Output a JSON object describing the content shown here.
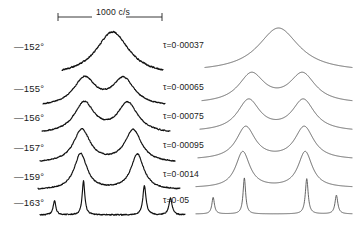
{
  "figure": {
    "background_color": "#ffffff",
    "trace_color": "#111111",
    "calc_color": "#4a4a4a"
  },
  "scale_bar": {
    "label": "1000 c/s",
    "units": "c/s",
    "value": 1000,
    "x_start_px": 58,
    "x_end_px": 162
  },
  "left_labels": [
    {
      "label": "—152°",
      "temperature": -152,
      "unit": "°"
    },
    {
      "label": "—155°",
      "temperature": -155,
      "unit": "°"
    },
    {
      "label": "—156°",
      "temperature": -156,
      "unit": "°"
    },
    {
      "label": "—157°",
      "temperature": -157,
      "unit": "°"
    },
    {
      "label": "—159°",
      "temperature": -159,
      "unit": "°"
    },
    {
      "label": "—163°",
      "temperature": -163,
      "unit": "°"
    }
  ],
  "tau_labels": [
    {
      "label": "τ=0·00037",
      "tau": 0.00037
    },
    {
      "label": "τ=0·00065",
      "tau": 0.00065
    },
    {
      "label": "τ=0·00075",
      "tau": 0.00075
    },
    {
      "label": "τ=0·00095",
      "tau": 0.00095
    },
    {
      "label": "τ=0·0014",
      "tau": 0.0014
    },
    {
      "label": "τ=0·05",
      "tau": 0.05
    }
  ],
  "chart_data": {
    "type": "line",
    "xlabel": "",
    "ylabel": "",
    "grid": false,
    "legend": "none",
    "x_scale_note": "Horizontal scale bar spans 1000 c/s",
    "panels": [
      {
        "name": "observed",
        "description": "Experimental noisy spectrometer traces stacked by temperature",
        "noise": true,
        "series": [
          {
            "name": "-152",
            "temperature": -152,
            "peaks": [
              {
                "center": 0.5,
                "height": 1.0,
                "width": 0.4
              }
            ],
            "baseline_tilt": 0.1,
            "noise_amplitude": 0.05
          },
          {
            "name": "-155",
            "temperature": -155,
            "peaks": [
              {
                "center": 0.34,
                "height": 0.82,
                "width": 0.22
              },
              {
                "center": 0.66,
                "height": 0.8,
                "width": 0.22
              }
            ],
            "dip": 0.1,
            "baseline_tilt": 0.12,
            "noise_amplitude": 0.05
          },
          {
            "name": "-156",
            "temperature": -156,
            "peaks": [
              {
                "center": 0.33,
                "height": 0.9,
                "width": 0.19
              },
              {
                "center": 0.67,
                "height": 0.88,
                "width": 0.19
              }
            ],
            "dip": 0.22,
            "baseline_tilt": 0.12,
            "noise_amplitude": 0.05
          },
          {
            "name": "-157",
            "temperature": -157,
            "peaks": [
              {
                "center": 0.31,
                "height": 0.97,
                "width": 0.15
              },
              {
                "center": 0.69,
                "height": 0.95,
                "width": 0.15
              }
            ],
            "dip": 0.34,
            "baseline_tilt": 0.12,
            "noise_amplitude": 0.05
          },
          {
            "name": "-159",
            "temperature": -159,
            "peaks": [
              {
                "center": 0.3,
                "height": 1.0,
                "width": 0.11
              },
              {
                "center": 0.7,
                "height": 0.98,
                "width": 0.11
              }
            ],
            "dip": 0.52,
            "baseline_tilt": 0.12,
            "noise_amplitude": 0.05
          },
          {
            "name": "-163",
            "temperature": -163,
            "peaks": [
              {
                "center": 0.1,
                "height": 0.42,
                "width": 0.022
              },
              {
                "center": 0.3,
                "height": 1.0,
                "width": 0.022
              },
              {
                "center": 0.72,
                "height": 0.86,
                "width": 0.026
              },
              {
                "center": 0.9,
                "height": 0.5,
                "width": 0.026
              }
            ],
            "dip": 0.92,
            "baseline_tilt": 0.04,
            "noise_amplitude": 0.055
          }
        ]
      },
      {
        "name": "calculated",
        "description": "Smooth computed lineshapes stacked by correlation time tau",
        "noise": false,
        "series": [
          {
            "name": "tau=0.00037",
            "tau": 0.00037,
            "peaks": [
              {
                "center": 0.5,
                "height": 1.0,
                "width": 0.34
              }
            ],
            "dip": 0.0
          },
          {
            "name": "tau=0.00065",
            "tau": 0.00065,
            "peaks": [
              {
                "center": 0.33,
                "height": 0.86,
                "width": 0.21
              },
              {
                "center": 0.67,
                "height": 0.86,
                "width": 0.21
              }
            ],
            "dip": 0.13
          },
          {
            "name": "tau=0.00075",
            "tau": 0.00075,
            "peaks": [
              {
                "center": 0.32,
                "height": 0.92,
                "width": 0.18
              },
              {
                "center": 0.68,
                "height": 0.92,
                "width": 0.18
              }
            ],
            "dip": 0.27
          },
          {
            "name": "tau=0.00095",
            "tau": 0.00095,
            "peaks": [
              {
                "center": 0.31,
                "height": 0.96,
                "width": 0.15
              },
              {
                "center": 0.69,
                "height": 0.96,
                "width": 0.15
              }
            ],
            "dip": 0.42
          },
          {
            "name": "tau=0.0014",
            "tau": 0.0014,
            "peaks": [
              {
                "center": 0.3,
                "height": 1.0,
                "width": 0.11
              },
              {
                "center": 0.7,
                "height": 1.0,
                "width": 0.11
              }
            ],
            "dip": 0.62
          },
          {
            "name": "tau=0.05",
            "tau": 0.05,
            "peaks": [
              {
                "center": 0.11,
                "height": 0.46,
                "width": 0.02
              },
              {
                "center": 0.31,
                "height": 1.0,
                "width": 0.02
              },
              {
                "center": 0.71,
                "height": 0.98,
                "width": 0.022
              },
              {
                "center": 0.9,
                "height": 0.52,
                "width": 0.022
              }
            ],
            "dip": 0.95
          }
        ]
      }
    ]
  }
}
